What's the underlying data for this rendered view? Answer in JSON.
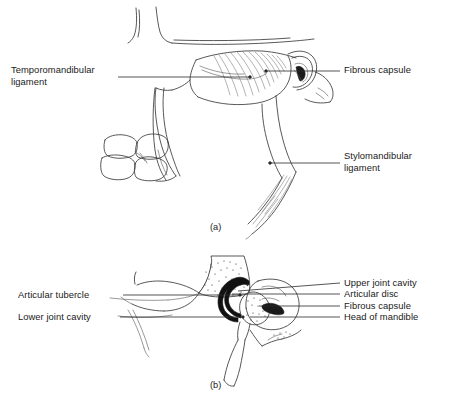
{
  "figure": {
    "background_color": "#ffffff",
    "ink_color": "#3a3a3a",
    "text_color": "#1a1a1a"
  },
  "panels": [
    {
      "id": "a",
      "caption": "(a)",
      "description": "Lateral view of skull and mandible showing temporomandibular ligament, fibrous capsule and stylomandibular ligament",
      "labels": [
        {
          "name": "temporomandibular-ligament",
          "text": "Temporomandibular\nligament",
          "side": "left"
        },
        {
          "name": "fibrous-capsule",
          "text": "Fibrous capsule",
          "side": "right"
        },
        {
          "name": "stylomandibular-ligament",
          "text": "Stylomandibular\nligament",
          "side": "right"
        }
      ]
    },
    {
      "id": "b",
      "caption": "(b)",
      "description": "Sagittal section through the temporomandibular joint showing joint cavities, articular disc and head of mandible",
      "labels": [
        {
          "name": "articular-tubercle",
          "text": "Articular tubercle",
          "side": "left"
        },
        {
          "name": "lower-joint-cavity",
          "text": "Lower joint cavity",
          "side": "left"
        },
        {
          "name": "upper-joint-cavity",
          "text": "Upper joint cavity",
          "side": "right"
        },
        {
          "name": "articular-disc",
          "text": "Articular disc",
          "side": "right"
        },
        {
          "name": "fibrous-capsule",
          "text": "Fibrous capsule",
          "side": "right"
        },
        {
          "name": "head-of-mandible",
          "text": "Head of mandible",
          "side": "right"
        }
      ]
    }
  ]
}
